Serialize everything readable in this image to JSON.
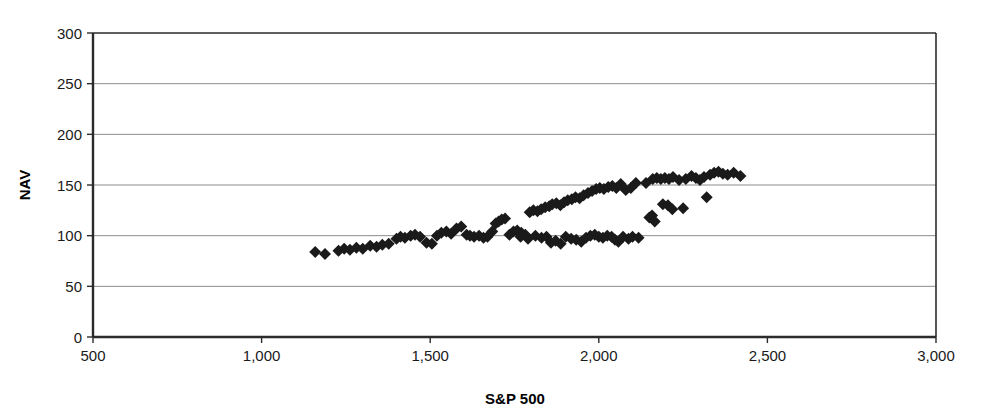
{
  "chart_data": {
    "type": "scatter",
    "title": "",
    "xlabel": "S&P 500",
    "ylabel": "NAV",
    "xlim": [
      500,
      3000
    ],
    "ylim": [
      0,
      300
    ],
    "xticks": [
      500,
      1000,
      1500,
      2000,
      2500,
      3000
    ],
    "xticklabels": [
      "500",
      "1,000",
      "1,500",
      "2,000",
      "2,500",
      "3,000"
    ],
    "yticks": [
      0,
      50,
      100,
      150,
      200,
      250,
      300
    ],
    "yticklabels": [
      "0",
      "50",
      "100",
      "150",
      "200",
      "250",
      "300"
    ],
    "grid": "horizontal",
    "legend": "none",
    "marker": "diamond",
    "marker_color": "#1a1a1a",
    "marker_size": 6,
    "series": [
      {
        "name": "NAV vs S&P 500",
        "points": [
          [
            1159,
            84
          ],
          [
            1188,
            82
          ],
          [
            1228,
            85
          ],
          [
            1245,
            87
          ],
          [
            1262,
            86
          ],
          [
            1281,
            88
          ],
          [
            1300,
            87
          ],
          [
            1322,
            90
          ],
          [
            1341,
            89
          ],
          [
            1358,
            91
          ],
          [
            1377,
            92
          ],
          [
            1400,
            97
          ],
          [
            1412,
            99
          ],
          [
            1425,
            98
          ],
          [
            1442,
            100
          ],
          [
            1455,
            101
          ],
          [
            1470,
            99
          ],
          [
            1489,
            93
          ],
          [
            1505,
            92
          ],
          [
            1520,
            100
          ],
          [
            1533,
            103
          ],
          [
            1548,
            104
          ],
          [
            1562,
            102
          ],
          [
            1578,
            107
          ],
          [
            1592,
            109
          ],
          [
            1608,
            101
          ],
          [
            1618,
            100
          ],
          [
            1630,
            99
          ],
          [
            1645,
            100
          ],
          [
            1658,
            98
          ],
          [
            1670,
            99
          ],
          [
            1684,
            104
          ],
          [
            1694,
            112
          ],
          [
            1703,
            114
          ],
          [
            1712,
            116
          ],
          [
            1722,
            117
          ],
          [
            1735,
            101
          ],
          [
            1747,
            104
          ],
          [
            1758,
            105
          ],
          [
            1770,
            103
          ],
          [
            1782,
            101
          ],
          [
            1795,
            123
          ],
          [
            1806,
            125
          ],
          [
            1818,
            124
          ],
          [
            1829,
            126
          ],
          [
            1841,
            128
          ],
          [
            1853,
            129
          ],
          [
            1862,
            131
          ],
          [
            1874,
            132
          ],
          [
            1886,
            130
          ],
          [
            1897,
            133
          ],
          [
            1908,
            135
          ],
          [
            1920,
            136
          ],
          [
            1931,
            138
          ],
          [
            1943,
            137
          ],
          [
            1955,
            140
          ],
          [
            1968,
            142
          ],
          [
            1980,
            144
          ],
          [
            1992,
            146
          ],
          [
            2003,
            147
          ],
          [
            2015,
            146
          ],
          [
            2028,
            148
          ],
          [
            2040,
            149
          ],
          [
            2052,
            147
          ],
          [
            2065,
            151
          ],
          [
            2080,
            145
          ],
          [
            2095,
            147
          ],
          [
            2110,
            152
          ],
          [
            2140,
            152
          ],
          [
            2160,
            156
          ],
          [
            2172,
            157
          ],
          [
            2184,
            156
          ],
          [
            2196,
            157
          ],
          [
            2208,
            156
          ],
          [
            2220,
            158
          ],
          [
            2238,
            155
          ],
          [
            2258,
            156
          ],
          [
            2275,
            159
          ],
          [
            2288,
            157
          ],
          [
            2300,
            155
          ],
          [
            2312,
            158
          ],
          [
            2330,
            160
          ],
          [
            2342,
            162
          ],
          [
            2355,
            163
          ],
          [
            2368,
            161
          ],
          [
            2382,
            160
          ],
          [
            2400,
            162
          ],
          [
            2420,
            159
          ],
          [
            1768,
            99
          ],
          [
            1790,
            97
          ],
          [
            1812,
            100
          ],
          [
            1830,
            98
          ],
          [
            1845,
            99
          ],
          [
            1858,
            93
          ],
          [
            1872,
            95
          ],
          [
            1887,
            92
          ],
          [
            1902,
            99
          ],
          [
            1918,
            97
          ],
          [
            1933,
            96
          ],
          [
            1948,
            94
          ],
          [
            1962,
            98
          ],
          [
            1975,
            100
          ],
          [
            1988,
            101
          ],
          [
            2000,
            99
          ],
          [
            2012,
            98
          ],
          [
            2025,
            100
          ],
          [
            2038,
            99
          ],
          [
            2048,
            96
          ],
          [
            2058,
            94
          ],
          [
            2072,
            99
          ],
          [
            2088,
            97
          ],
          [
            2100,
            99
          ],
          [
            2118,
            98
          ],
          [
            2150,
            118
          ],
          [
            2158,
            120
          ],
          [
            2166,
            114
          ],
          [
            2190,
            131
          ],
          [
            2205,
            130
          ],
          [
            2218,
            126
          ],
          [
            2250,
            127
          ],
          [
            2320,
            138
          ]
        ]
      }
    ]
  },
  "axes": {
    "y_axis_label": "NAV",
    "x_axis_label": "S&P 500"
  }
}
